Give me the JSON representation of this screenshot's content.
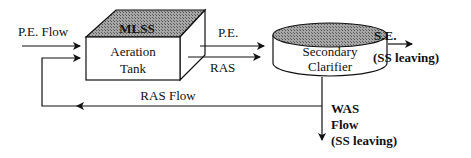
{
  "diagram": {
    "inflow_label": "P.E. Flow",
    "aeration_tank": {
      "top_label": "MLSS",
      "line1": "Aeration",
      "line2": "Tank"
    },
    "pe_label": "P.E.",
    "ras_label": "RAS",
    "clarifier": {
      "line1": "Secondary",
      "line2": "Clarifier"
    },
    "effluent": {
      "label": "S.E.",
      "sub": "(SS leaving)"
    },
    "ras_flow_label": "RAS Flow",
    "was": {
      "line1": "WAS",
      "line2": "Flow",
      "line3": "(SS leaving)"
    },
    "colors": {
      "line": "#111111",
      "hatch": "#8a8a8a",
      "background": "#ffffff"
    }
  }
}
